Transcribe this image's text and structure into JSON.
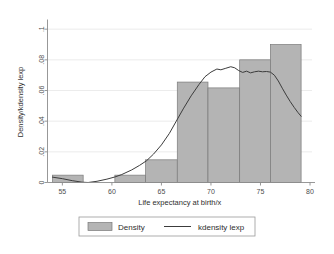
{
  "chart_data": {
    "type": "bar",
    "title": "",
    "subtitle": "",
    "xlabel": "Life expectancy at birth/x",
    "ylabel": "Density/kdensity lexp",
    "xlim": [
      53.5,
      80.2
    ],
    "ylim": [
      0,
      0.105
    ],
    "grid": true,
    "grid_axis": "y",
    "legend_position": "bottom-outside",
    "xticks": [
      55,
      60,
      65,
      70,
      75,
      80
    ],
    "xtick_labels": [
      "55",
      "60",
      "65",
      "70",
      "75",
      "80"
    ],
    "yticks": [
      0,
      0.02,
      0.04,
      0.06,
      0.08,
      0.1
    ],
    "ytick_labels": [
      "0",
      ".02",
      ".04",
      ".06",
      ".08",
      ".1"
    ],
    "series": [
      {
        "name": "Density",
        "type": "bar",
        "color": "#b4b4b4",
        "edge_color": "#7a7a7a",
        "bin_edges": [
          54.0,
          57.1,
          60.3,
          63.4,
          66.6,
          69.7,
          72.9,
          76.0,
          79.1
        ],
        "bin_centers": [
          55.6,
          58.7,
          61.9,
          65.0,
          68.1,
          71.3,
          74.4,
          77.6
        ],
        "values": [
          0.0048,
          0.0,
          0.0048,
          0.0148,
          0.0655,
          0.0617,
          0.08,
          0.09
        ]
      },
      {
        "name": "kdensity lexp",
        "type": "line",
        "color": "#3c3c3c",
        "x": [
          54.0,
          55.0,
          56.0,
          57.0,
          57.6,
          58.5,
          59.5,
          60.3,
          61.0,
          62.0,
          62.8,
          63.5,
          64.2,
          65.0,
          65.8,
          66.5,
          67.2,
          68.0,
          68.8,
          69.4,
          70.0,
          70.6,
          71.0,
          71.5,
          72.0,
          72.4,
          72.8,
          73.2,
          73.6,
          74.0,
          74.4,
          74.8,
          75.2,
          75.6,
          76.0,
          76.4,
          76.8,
          77.2,
          77.6,
          78.0,
          78.4,
          78.8,
          79.1
        ],
        "y": [
          0.0035,
          0.0025,
          0.0012,
          0.0002,
          0.0,
          0.0008,
          0.0022,
          0.0036,
          0.0052,
          0.0082,
          0.0112,
          0.0142,
          0.0185,
          0.0245,
          0.032,
          0.04,
          0.048,
          0.0565,
          0.064,
          0.069,
          0.072,
          0.074,
          0.0735,
          0.0745,
          0.0755,
          0.0748,
          0.073,
          0.0718,
          0.0726,
          0.0715,
          0.0722,
          0.0726,
          0.0722,
          0.0724,
          0.072,
          0.07,
          0.0662,
          0.0615,
          0.057,
          0.0528,
          0.049,
          0.0455,
          0.0432
        ]
      }
    ]
  },
  "legend": {
    "items": [
      {
        "label": "Density",
        "marker": "swatch",
        "color": "#b4b4b4"
      },
      {
        "label": "kdensity lexp",
        "marker": "line",
        "color": "#3c3c3c"
      }
    ]
  }
}
